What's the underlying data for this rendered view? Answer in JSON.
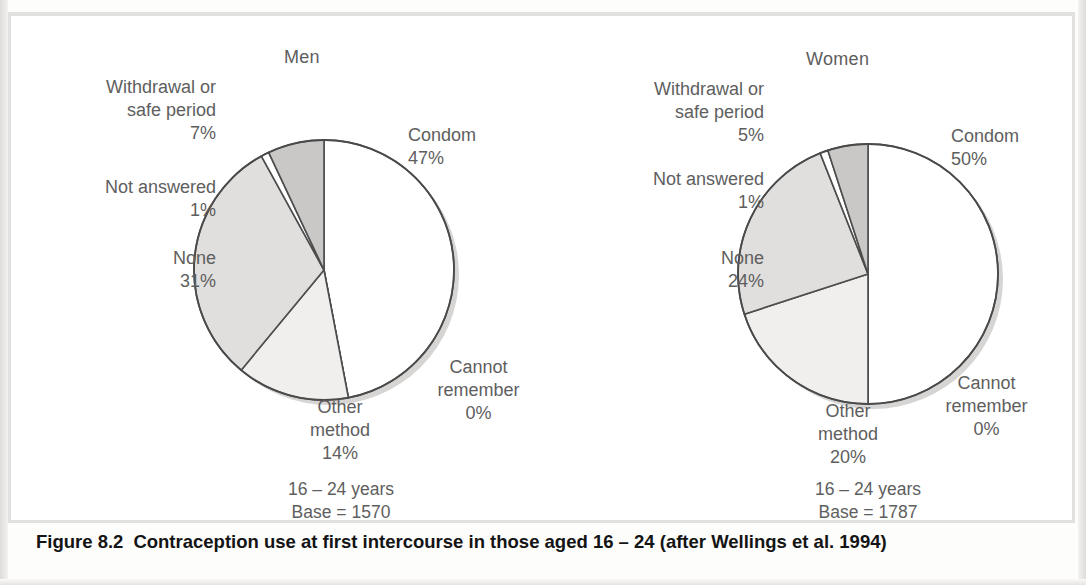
{
  "figure": {
    "caption_label": "Figure 8.2",
    "caption_text": "Contraception use at first intercourse in those aged 16 – 24 (after Wellings et al. 1994)"
  },
  "charts": [
    {
      "title": "Men",
      "age_note": "16 – 24 years",
      "base_note": "Base = 1570",
      "labels": {
        "condom": "Condom\n47%",
        "cannot_remember": "Cannot\nremember\n0%",
        "other_method": "Other\nmethod\n14%",
        "none": "None\n31%",
        "not_answered": "Not answered\n1%",
        "withdrawal": "Withdrawal or\nsafe period\n7%"
      }
    },
    {
      "title": "Women",
      "age_note": "16 – 24 years",
      "base_note": "Base = 1787",
      "labels": {
        "condom": "Condom\n50%",
        "cannot_remember": "Cannot\nremember\n0%",
        "other_method": "Other\nmethod\n20%",
        "none": "None\n24%",
        "not_answered": "Not answered\n1%",
        "withdrawal": "Withdrawal or\nsafe period\n5%"
      }
    }
  ],
  "chart_data": [
    {
      "type": "pie",
      "title": "Men",
      "subtitle": "16 – 24 years, Base = 1570",
      "base": 1570,
      "age_group": "16-24",
      "unit": "percent",
      "start_angle_deg": 0,
      "direction": "clockwise",
      "categories": [
        "Condom",
        "Cannot remember",
        "Other method",
        "None",
        "Not answered",
        "Withdrawal or safe period"
      ],
      "values": [
        47,
        0,
        14,
        31,
        1,
        7
      ],
      "colors": [
        "#ffffff",
        "#ffffff",
        "#f0efee",
        "#e0dfdd",
        "#ffffff",
        "#c9c8c6"
      ],
      "legend": "labels-outside",
      "grid": false
    },
    {
      "type": "pie",
      "title": "Women",
      "subtitle": "16 – 24 years, Base = 1787",
      "base": 1787,
      "age_group": "16-24",
      "unit": "percent",
      "start_angle_deg": 0,
      "direction": "clockwise",
      "categories": [
        "Condom",
        "Cannot remember",
        "Other method",
        "None",
        "Not answered",
        "Withdrawal or safe period"
      ],
      "values": [
        50,
        0,
        20,
        24,
        1,
        5
      ],
      "colors": [
        "#ffffff",
        "#ffffff",
        "#f0efee",
        "#e0dfdd",
        "#ffffff",
        "#c9c8c6"
      ],
      "legend": "labels-outside",
      "grid": false
    }
  ]
}
